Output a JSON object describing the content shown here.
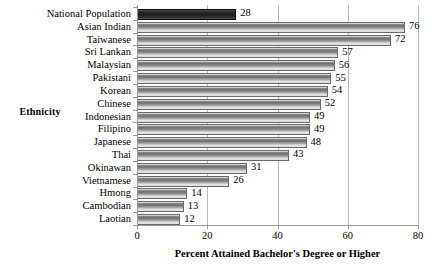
{
  "chart_data": {
    "type": "bar",
    "orientation": "horizontal",
    "title": "",
    "xlabel": "Percent Attained Bachelor's Degree or Higher",
    "ylabel": "Ethnicity",
    "xlim": [
      0,
      80
    ],
    "xticks": [
      0,
      20,
      40,
      60,
      80
    ],
    "grid": "vertical",
    "legend": "none",
    "highlight_category": "National Population",
    "categories": [
      "National Population",
      "Asian Indian",
      "Taiwanese",
      "Sri Lankan",
      "Malaysian",
      "Pakistani",
      "Korean",
      "Chinese",
      "Indonesian",
      "Filipino",
      "Japanese",
      "Thai",
      "Okinawan",
      "Vietnamese",
      "Hmong",
      "Cambodian",
      "Laotian"
    ],
    "values": [
      28,
      76,
      72,
      57,
      56,
      55,
      54,
      52,
      49,
      49,
      48,
      43,
      31,
      26,
      14,
      13,
      12
    ],
    "data_labels": [
      "28",
      "76",
      "72",
      "57",
      "56",
      "55",
      "54",
      "52",
      "49",
      "49",
      "48",
      "43",
      "31",
      "26",
      "14",
      "13",
      "12"
    ],
    "colors": {
      "bar_fill_dark": "#6f6f6f",
      "bar_fill_light": "#efefef",
      "bar_outline": "#6a6a6a",
      "highlight_fill": "#1c1c1c",
      "axis": "#9a9a9a",
      "gridline": "#b9b9b9",
      "text": "#000000",
      "background": "#ffffff"
    }
  }
}
